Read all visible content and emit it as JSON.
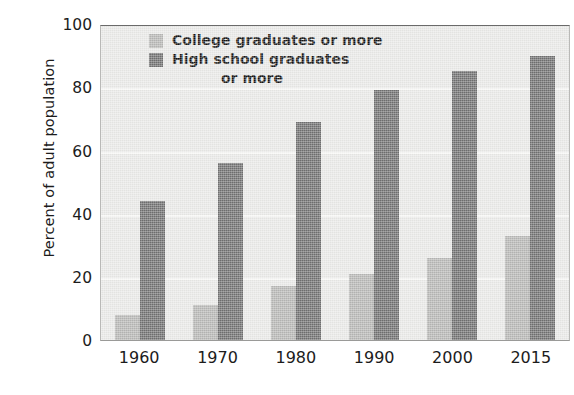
{
  "chart_data": {
    "type": "bar",
    "title": "",
    "xlabel": "",
    "ylabel": "Percent of adult population",
    "categories": [
      "1960",
      "1970",
      "1980",
      "1990",
      "2000",
      "2015"
    ],
    "series": [
      {
        "name": "College graduates or more",
        "color": "#b6b6b4",
        "values": [
          8,
          11,
          17,
          21,
          26,
          33
        ]
      },
      {
        "name": "High school graduates or more",
        "color": "#6f6f6f",
        "values": [
          44,
          56,
          69,
          79,
          85,
          90
        ]
      }
    ],
    "ylim": [
      0,
      100
    ],
    "yticks": [
      0,
      20,
      40,
      60,
      80,
      100
    ],
    "ytick_labels": [
      "0",
      "20",
      "40",
      "60",
      "80",
      "100"
    ],
    "grid": true,
    "legend_position": "inside-top-left",
    "legend_entries": [
      "College graduates or more",
      "High school graduates",
      "or more"
    ],
    "plot_background": "#e9e9e7"
  },
  "axis": {
    "y_title": "Percent of adult population",
    "y_ticks": [
      "100",
      "80",
      "60",
      "40",
      "20",
      "0"
    ],
    "x_ticks": [
      "1960",
      "1970",
      "1980",
      "1990",
      "2000",
      "2015"
    ]
  },
  "legend": {
    "line1": "College graduates or more",
    "line2": "High school graduates",
    "line3": "or more"
  }
}
